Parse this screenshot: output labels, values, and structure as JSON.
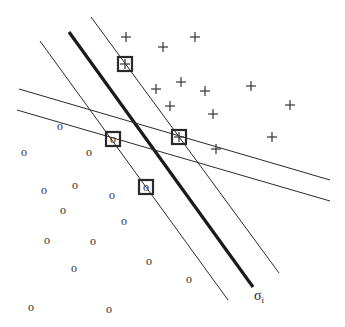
{
  "diagram": {
    "label": {
      "main": "σ",
      "subscript": "i"
    },
    "positive_symbol": "+",
    "negative_symbol": "o",
    "positive_class_count": 14,
    "negative_class_count": 16,
    "support_vector_count": 4,
    "colors": {
      "line": "#222222",
      "marker": "#333333",
      "background": "#ffffff"
    }
  }
}
